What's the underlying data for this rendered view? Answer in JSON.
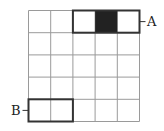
{
  "diagram": {
    "grid": {
      "rows": 5,
      "cols": 5,
      "line_color": "#9a9a9a",
      "bold_color": "#333333",
      "fill_color": "#222222"
    },
    "shaded_cell": {
      "row": 0,
      "col": 3
    },
    "rect_A": {
      "row": 0,
      "col_start": 2,
      "col_end": 4,
      "label": "A"
    },
    "rect_B": {
      "row": 4,
      "col_start": 0,
      "col_end": 1,
      "label": "B"
    }
  }
}
